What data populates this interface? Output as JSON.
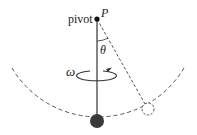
{
  "diagram": {
    "type": "conical pendulum",
    "labels": {
      "pivot": "pivot",
      "point": "P",
      "angle": "θ",
      "angular_velocity": "ω"
    },
    "colors": {
      "line": "#444444",
      "rod": "#555555",
      "bob": "#3a3a3a",
      "dashed": "#555555"
    }
  }
}
